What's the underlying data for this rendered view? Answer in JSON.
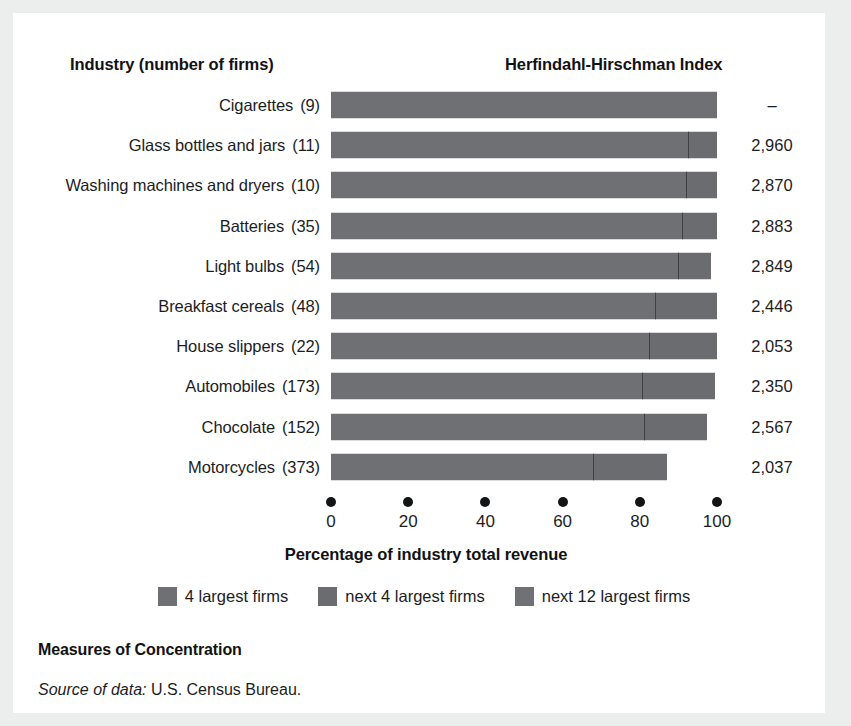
{
  "figure": {
    "caption_title": "Measures of Concentration",
    "source_label": "Source of data:",
    "source_text": " U.S. Census Bureau."
  },
  "headers": {
    "industry": "Industry (number of firms)",
    "hhi": "Herfindahl-Hirschman Index"
  },
  "legend": {
    "items": [
      {
        "label": "4 largest firms",
        "color": "#6e7073"
      },
      {
        "label": "next 4 largest firms",
        "color": "#6a6c6f"
      },
      {
        "label": "next 12 largest firms",
        "color": "#6f7174"
      }
    ]
  },
  "chart_data": {
    "type": "bar",
    "orientation": "horizontal",
    "stacked": true,
    "title": "Measures of Concentration",
    "xlabel": "Percentage of industry total revenue",
    "ylabel": "Industry (number of firms)",
    "xlim": [
      0,
      100
    ],
    "xticks": [
      0,
      20,
      40,
      60,
      80,
      100
    ],
    "xticklabels": [
      "0",
      "20",
      "40",
      "60",
      "80",
      "100"
    ],
    "grid": false,
    "legend_position": "bottom",
    "series": [
      {
        "name": "4 largest firms",
        "values": [
          100.0,
          92.5,
          92.0,
          91.0,
          90.0,
          84.0,
          82.5,
          80.5,
          81.0,
          68.0
        ]
      },
      {
        "name": "next 4 largest firms",
        "values": [
          0.0,
          7.5,
          8.0,
          9.0,
          8.5,
          14.0,
          17.5,
          19.5,
          17.0,
          19.0
        ]
      },
      {
        "name": "next 12 largest firms",
        "values": [
          0.0,
          0.0,
          0.0,
          0.0,
          0.0,
          0.0,
          0.0,
          0.0,
          0.0,
          0.0
        ]
      }
    ],
    "categories": [
      "Cigarettes",
      "Glass bottles and jars",
      "Washing machines and dryers",
      "Batteries",
      "Light bulbs",
      "Breakfast cereals",
      "House slippers",
      "Automobiles",
      "Chocolate",
      "Motorcycles"
    ],
    "rows": [
      {
        "industry": "Cigarettes",
        "firms": "(9)",
        "hhi": "–",
        "seg1": 100.0,
        "seg2": 0.0,
        "total": 100.0
      },
      {
        "industry": "Glass bottles and jars",
        "firms": "(11)",
        "hhi": "2,960",
        "seg1": 92.5,
        "seg2": 7.5,
        "total": 100.0
      },
      {
        "industry": "Washing machines and dryers",
        "firms": "(10)",
        "hhi": "2,870",
        "seg1": 92.0,
        "seg2": 8.0,
        "total": 100.0
      },
      {
        "industry": "Batteries",
        "firms": "(35)",
        "hhi": "2,883",
        "seg1": 91.0,
        "seg2": 9.0,
        "total": 100.0
      },
      {
        "industry": "Light bulbs",
        "firms": "(54)",
        "hhi": "2,849",
        "seg1": 90.0,
        "seg2": 8.5,
        "total": 98.5
      },
      {
        "industry": "Breakfast cereals",
        "firms": "(48)",
        "hhi": "2,446",
        "seg1": 84.0,
        "seg2": 16.0,
        "total": 100.0
      },
      {
        "industry": "House slippers",
        "firms": "(22)",
        "hhi": "2,053",
        "seg1": 82.5,
        "seg2": 17.5,
        "total": 100.0
      },
      {
        "industry": "Automobiles",
        "firms": "(173)",
        "hhi": "2,350",
        "seg1": 80.5,
        "seg2": 19.0,
        "total": 99.5
      },
      {
        "industry": "Chocolate",
        "firms": "(152)",
        "hhi": "2,567",
        "seg1": 81.0,
        "seg2": 16.5,
        "total": 97.5
      },
      {
        "industry": "Motorcycles",
        "firms": "(373)",
        "hhi": "2,037",
        "seg1": 68.0,
        "seg2": 19.0,
        "total": 87.0
      }
    ]
  }
}
